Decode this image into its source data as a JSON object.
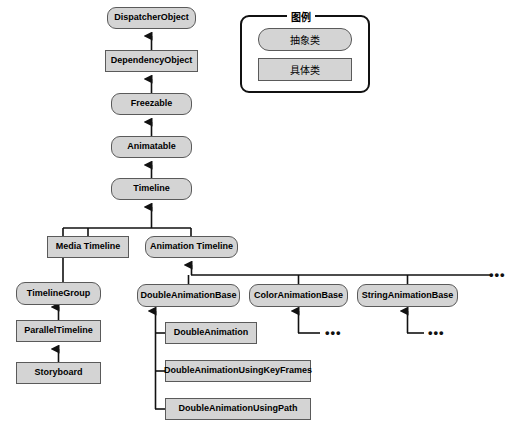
{
  "diagram": {
    "background_color": "#ffffff",
    "node_fill_color": "#d4d4d4",
    "node_border_color": "#5a5a5a",
    "edge_color": "#111111"
  },
  "legend": {
    "title": "图例",
    "items": [
      {
        "label": "抽象类",
        "shape": "rounded"
      },
      {
        "label": "具体类",
        "shape": "rectangle"
      }
    ]
  },
  "nodes": [
    {
      "id": "dispatcher_object",
      "label": "DispatcherObject",
      "shape": "rounded",
      "x": 107,
      "y": 7,
      "w": 89,
      "h": 22
    },
    {
      "id": "dependency_object",
      "label": "DependencyObject",
      "shape": "rectangle",
      "x": 105,
      "y": 50,
      "w": 93,
      "h": 22
    },
    {
      "id": "freezable",
      "label": "Freezable",
      "shape": "rounded",
      "x": 111,
      "y": 93,
      "w": 81,
      "h": 22
    },
    {
      "id": "animatable",
      "label": "Animatable",
      "shape": "rounded",
      "x": 111,
      "y": 136,
      "w": 81,
      "h": 22
    },
    {
      "id": "timeline",
      "label": "Timeline",
      "shape": "rounded",
      "x": 111,
      "y": 178,
      "w": 81,
      "h": 22
    },
    {
      "id": "media_timeline",
      "label": "Media Timeline",
      "shape": "rectangle",
      "x": 47,
      "y": 236,
      "w": 82,
      "h": 22
    },
    {
      "id": "animation_timeline",
      "label": "Animation Timeline",
      "shape": "rounded",
      "x": 145,
      "y": 236,
      "w": 93,
      "h": 22
    },
    {
      "id": "timeline_group",
      "label": "TimelineGroup",
      "shape": "rounded",
      "x": 16,
      "y": 282,
      "w": 85,
      "h": 23
    },
    {
      "id": "parallel_timeline",
      "label": "ParallelTimeline",
      "shape": "rectangle",
      "x": 16,
      "y": 320,
      "w": 85,
      "h": 22
    },
    {
      "id": "storyboard",
      "label": "Storyboard",
      "shape": "rectangle",
      "x": 16,
      "y": 362,
      "w": 85,
      "h": 22
    },
    {
      "id": "double_animation_base",
      "label": "DoubleAnimationBase",
      "shape": "rounded",
      "x": 137,
      "y": 284,
      "w": 103,
      "h": 23
    },
    {
      "id": "color_animation_base",
      "label": "ColorAnimationBase",
      "shape": "rounded",
      "x": 249,
      "y": 284,
      "w": 99,
      "h": 23
    },
    {
      "id": "string_animation_base",
      "label": "StringAnimationBase",
      "shape": "rounded",
      "x": 357,
      "y": 284,
      "w": 101,
      "h": 23
    },
    {
      "id": "double_animation",
      "label": "DoubleAnimation",
      "shape": "rectangle",
      "x": 165,
      "y": 322,
      "w": 92,
      "h": 22
    },
    {
      "id": "double_animation_using_key_frames",
      "label": "DoubleAnimationUsingKeyFrames",
      "shape": "rectangle",
      "x": 165,
      "y": 360,
      "w": 146,
      "h": 22
    },
    {
      "id": "double_animation_using_path",
      "label": "DoubleAnimationUsingPath",
      "shape": "rectangle",
      "x": 165,
      "y": 398,
      "w": 146,
      "h": 22
    }
  ],
  "ellipses": [
    {
      "id": "top-bus-ellipsis",
      "text": "•••",
      "x": 489,
      "y": 272
    },
    {
      "id": "color-animation-ellipsis",
      "text": "•••",
      "x": 325,
      "y": 330
    },
    {
      "id": "string-animation-ellipsis",
      "text": "•••",
      "x": 428,
      "y": 330
    }
  ]
}
